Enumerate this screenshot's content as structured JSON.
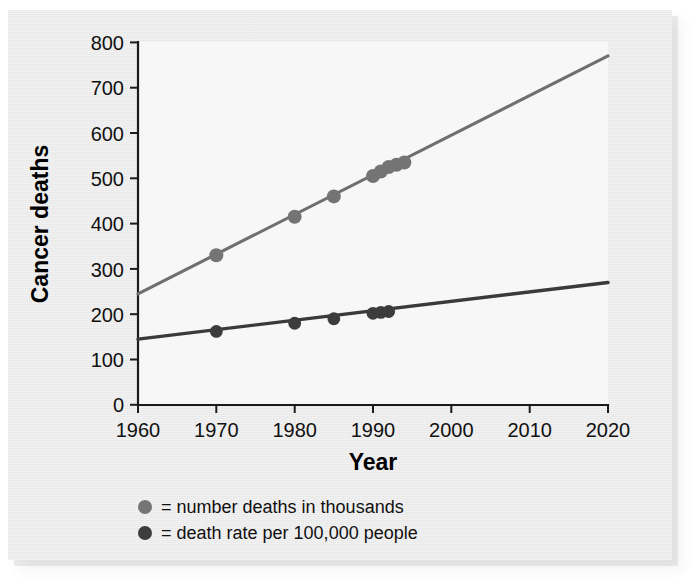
{
  "chart_data": {
    "type": "line",
    "title": "",
    "xlabel": "Year",
    "ylabel": "Cancer deaths",
    "xlim": [
      1960,
      2020
    ],
    "ylim": [
      0,
      800
    ],
    "xticks": [
      1960,
      1970,
      1980,
      1990,
      2000,
      2010,
      2020
    ],
    "yticks": [
      0,
      100,
      200,
      300,
      400,
      500,
      600,
      700,
      800
    ],
    "grid": false,
    "legend_position": "below-axis",
    "series": [
      {
        "name": "number deaths in thousands",
        "legend_label": "= number deaths in thousands",
        "color": "#747474",
        "trendline": {
          "x": [
            1960,
            2020
          ],
          "y": [
            245,
            770
          ]
        },
        "x": [
          1970,
          1980,
          1985,
          1990,
          1991,
          1992,
          1993,
          1994
        ],
        "values": [
          330,
          415,
          460,
          505,
          515,
          525,
          530,
          535
        ]
      },
      {
        "name": "death rate per 100,000 people",
        "legend_label": "= death rate per 100,000 people",
        "color": "#3c3c3c",
        "trendline": {
          "x": [
            1960,
            2020
          ],
          "y": [
            145,
            270
          ]
        },
        "x": [
          1970,
          1980,
          1985,
          1990,
          1991,
          1992
        ],
        "values": [
          162,
          180,
          190,
          202,
          204,
          206
        ]
      }
    ]
  },
  "axes": {
    "y_title": "Cancer deaths",
    "x_title": "Year",
    "y_tick_labels": [
      "800",
      "700",
      "600",
      "500",
      "400",
      "300",
      "200",
      "100",
      "0"
    ],
    "x_tick_labels": [
      "1960",
      "1970",
      "1980",
      "1990",
      "2000",
      "2010",
      "2020"
    ]
  },
  "legend": {
    "items": [
      {
        "marker": "filled-circle-gray",
        "label": "= number deaths in thousands"
      },
      {
        "marker": "filled-circle-dark",
        "label": "= death rate per 100,000 people"
      }
    ]
  },
  "colors": {
    "series_a": "#747474",
    "series_b": "#3c3c3c",
    "axis": "#1b1b1b",
    "panel_background": "#ececed",
    "plot_background": "#f7f7f8"
  }
}
